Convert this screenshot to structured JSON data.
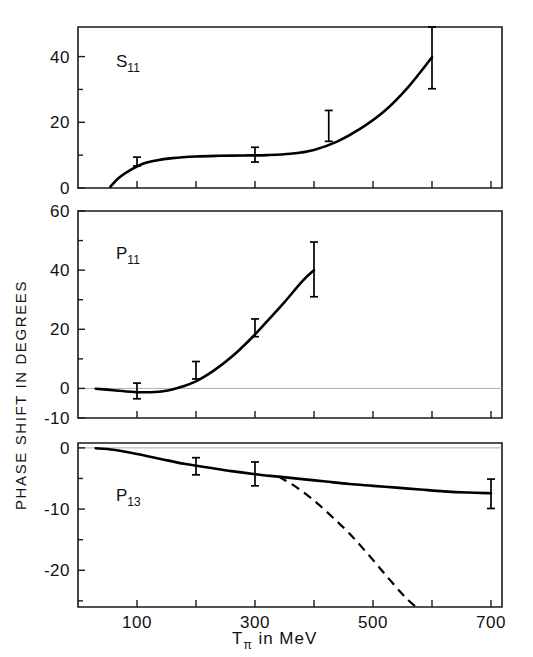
{
  "figure": {
    "y_axis_title": "PHASE SHIFT IN DEGREES",
    "x_axis_title_main": "T",
    "x_axis_title_sub": "π",
    "x_axis_title_rest": " in  MeV"
  },
  "chart_data": [
    {
      "type": "line",
      "title": "S11",
      "panel_label_main": "S",
      "panel_label_sub": "11",
      "xlabel": "Tπ in MeV",
      "ylabel": "PHASE SHIFT IN DEGREES",
      "xlim": [
        0,
        720
      ],
      "ylim": [
        0,
        49
      ],
      "yticks": [
        0,
        20,
        40
      ],
      "yticklabels": [
        "0",
        "20",
        "40"
      ],
      "xticks": [
        100,
        200,
        300,
        400,
        500,
        600,
        700
      ],
      "xticklabels": [
        "",
        "",
        "",
        "",
        "",
        "",
        ""
      ],
      "grid": false,
      "legend": "none",
      "series": [
        {
          "name": "S11 fit curve",
          "style": "solid",
          "x": [
            55,
            70,
            90,
            110,
            130,
            160,
            200,
            240,
            280,
            320,
            360,
            400,
            440,
            480,
            520,
            560,
            600
          ],
          "y": [
            0.4,
            3.2,
            5.6,
            7.4,
            8.3,
            9.1,
            9.6,
            9.8,
            9.9,
            10.0,
            10.4,
            11.6,
            14.2,
            18.2,
            23.5,
            30.8,
            39.8
          ]
        }
      ],
      "points": [
        {
          "x": 100,
          "y": 8.0,
          "yerr_low": 6.7,
          "yerr_high": 9.4
        },
        {
          "x": 300,
          "y": 10.0,
          "yerr_low": 7.9,
          "yerr_high": 12.4
        },
        {
          "x": 425,
          "y": 19.0,
          "yerr_low": 14.2,
          "yerr_high": 23.6
        },
        {
          "x": 600,
          "y": 40.0,
          "yerr_low": 30.2,
          "yerr_high": 49.0
        }
      ]
    },
    {
      "type": "line",
      "title": "P11",
      "panel_label_main": "P",
      "panel_label_sub": "11",
      "xlabel": "Tπ in MeV",
      "ylabel": "PHASE SHIFT IN DEGREES",
      "xlim": [
        0,
        720
      ],
      "ylim": [
        -10,
        60
      ],
      "yticks": [
        -10,
        0,
        20,
        40,
        60
      ],
      "yticklabels": [
        "-10",
        "0",
        "20",
        "40",
        "60"
      ],
      "xticks": [
        100,
        200,
        300,
        400,
        500,
        600,
        700
      ],
      "xticklabels": [
        "",
        "",
        "",
        "",
        "",
        "",
        ""
      ],
      "grid": false,
      "zero_reference_line": true,
      "legend": "none",
      "series": [
        {
          "name": "P11 fit curve",
          "style": "solid",
          "x": [
            30,
            60,
            90,
            110,
            130,
            150,
            170,
            200,
            230,
            260,
            290,
            320,
            350,
            380,
            400
          ],
          "y": [
            -0.1,
            -0.6,
            -1.1,
            -1.3,
            -1.2,
            -0.8,
            0.2,
            2.4,
            6.0,
            10.6,
            16.2,
            22.6,
            29.2,
            36.2,
            40.0
          ]
        }
      ],
      "points": [
        {
          "x": 100,
          "y": -1.1,
          "yerr_low": -3.5,
          "yerr_high": 1.8
        },
        {
          "x": 200,
          "y": 6.0,
          "yerr_low": 3.2,
          "yerr_high": 9.1
        },
        {
          "x": 300,
          "y": 20.0,
          "yerr_low": 17.5,
          "yerr_high": 23.5
        },
        {
          "x": 400,
          "y": 40.0,
          "yerr_low": 31.0,
          "yerr_high": 49.5
        }
      ]
    },
    {
      "type": "line",
      "title": "P13",
      "panel_label_main": "P",
      "panel_label_sub": "13",
      "xlabel": "Tπ in MeV",
      "ylabel": "PHASE SHIFT IN DEGREES",
      "xlim": [
        0,
        720
      ],
      "ylim": [
        -26,
        0.8
      ],
      "yticks": [
        0,
        -10,
        -20
      ],
      "yticklabels": [
        "0",
        "-10",
        "-20"
      ],
      "xticks": [
        100,
        200,
        300,
        400,
        500,
        600,
        700
      ],
      "xticklabels": [
        "100",
        "",
        "300",
        "",
        "500",
        "",
        "700"
      ],
      "grid": false,
      "zero_reference_line": true,
      "legend": "none",
      "series": [
        {
          "name": "P13 solid curve",
          "style": "solid",
          "x": [
            30,
            60,
            100,
            140,
            180,
            220,
            260,
            300,
            340,
            380,
            420,
            460,
            500,
            540,
            580,
            620,
            660,
            700
          ],
          "y": [
            -0.05,
            -0.3,
            -1.0,
            -1.8,
            -2.6,
            -3.2,
            -3.8,
            -4.3,
            -4.7,
            -5.1,
            -5.5,
            -5.9,
            -6.2,
            -6.5,
            -6.8,
            -7.1,
            -7.3,
            -7.4
          ]
        },
        {
          "name": "P13 dashed curve",
          "style": "dashed",
          "x": [
            340,
            370,
            400,
            430,
            460,
            490,
            520,
            545,
            560,
            575
          ],
          "y": [
            -4.7,
            -6.4,
            -8.6,
            -11.2,
            -14.0,
            -17.2,
            -20.6,
            -23.4,
            -24.9,
            -26.2
          ]
        }
      ],
      "points": [
        {
          "x": 200,
          "y": -3.0,
          "yerr_low": -4.4,
          "yerr_high": -1.6
        },
        {
          "x": 300,
          "y": -4.2,
          "yerr_low": -6.2,
          "yerr_high": -2.3
        },
        {
          "x": 700,
          "y": -7.4,
          "yerr_low": -9.9,
          "yerr_high": -5.1
        }
      ]
    }
  ]
}
